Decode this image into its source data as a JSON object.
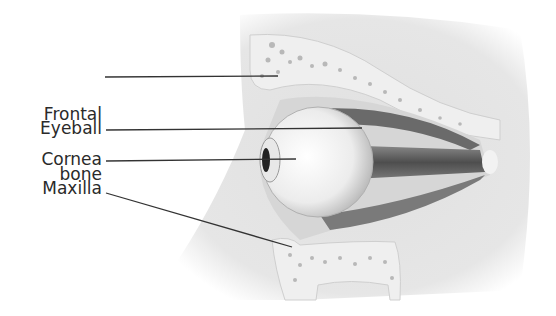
{
  "diagram": {
    "labels": [
      {
        "id": "frontal",
        "line1": "Frontal",
        "line2": "bone"
      },
      {
        "id": "eyeball",
        "line1": "Eyeball"
      },
      {
        "id": "cornea",
        "line1": "Cornea"
      },
      {
        "id": "maxilla",
        "line1": "Maxilla"
      }
    ],
    "colors": {
      "background": "#ffffff",
      "text": "#2a2a2a",
      "leader_line": "#333333",
      "skin": "#e4e4e4",
      "bone": "#eeeeee",
      "bone_speckle": "#b8b8b8",
      "muscle": "#6a6a6a",
      "eyeball": "#f4f4f4"
    }
  }
}
